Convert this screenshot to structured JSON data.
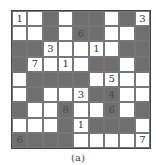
{
  "figure": {
    "caption": "(a)",
    "rows": 9,
    "cols": 9,
    "colors": {
      "shaded": "#6f6f6f",
      "unshaded": "#ffffff",
      "border": "#444444"
    }
  },
  "grid": [
    [
      {
        "s": 0,
        "n": "1"
      },
      {
        "s": 0,
        "n": ""
      },
      {
        "s": 1,
        "n": ""
      },
      {
        "s": 0,
        "n": ""
      },
      {
        "s": 1,
        "n": ""
      },
      {
        "s": 1,
        "n": ""
      },
      {
        "s": 0,
        "n": ""
      },
      {
        "s": 1,
        "n": ""
      },
      {
        "s": 0,
        "n": "3"
      }
    ],
    [
      {
        "s": 0,
        "n": ""
      },
      {
        "s": 0,
        "n": ""
      },
      {
        "s": 1,
        "n": ""
      },
      {
        "s": 0,
        "n": ""
      },
      {
        "s": 1,
        "n": "6"
      },
      {
        "s": 1,
        "n": ""
      },
      {
        "s": 0,
        "n": ""
      },
      {
        "s": 0,
        "n": ""
      },
      {
        "s": 1,
        "n": ""
      }
    ],
    [
      {
        "s": 1,
        "n": ""
      },
      {
        "s": 1,
        "n": ""
      },
      {
        "s": 0,
        "n": "3"
      },
      {
        "s": 0,
        "n": ""
      },
      {
        "s": 0,
        "n": ""
      },
      {
        "s": 0,
        "n": "1"
      },
      {
        "s": 0,
        "n": ""
      },
      {
        "s": 1,
        "n": ""
      },
      {
        "s": 1,
        "n": ""
      }
    ],
    [
      {
        "s": 1,
        "n": ""
      },
      {
        "s": 0,
        "n": "7"
      },
      {
        "s": 0,
        "n": ""
      },
      {
        "s": 0,
        "n": "1"
      },
      {
        "s": 0,
        "n": ""
      },
      {
        "s": 1,
        "n": ""
      },
      {
        "s": 1,
        "n": ""
      },
      {
        "s": 0,
        "n": ""
      },
      {
        "s": 1,
        "n": ""
      }
    ],
    [
      {
        "s": 0,
        "n": ""
      },
      {
        "s": 1,
        "n": ""
      },
      {
        "s": 1,
        "n": ""
      },
      {
        "s": 1,
        "n": ""
      },
      {
        "s": 1,
        "n": ""
      },
      {
        "s": 0,
        "n": ""
      },
      {
        "s": 0,
        "n": "5"
      },
      {
        "s": 0,
        "n": ""
      },
      {
        "s": 0,
        "n": ""
      }
    ],
    [
      {
        "s": 0,
        "n": ""
      },
      {
        "s": 1,
        "n": ""
      },
      {
        "s": 0,
        "n": ""
      },
      {
        "s": 0,
        "n": ""
      },
      {
        "s": 0,
        "n": "3"
      },
      {
        "s": 1,
        "n": ""
      },
      {
        "s": 1,
        "n": "4"
      },
      {
        "s": 0,
        "n": ""
      },
      {
        "s": 0,
        "n": ""
      }
    ],
    [
      {
        "s": 1,
        "n": ""
      },
      {
        "s": 0,
        "n": ""
      },
      {
        "s": 0,
        "n": ""
      },
      {
        "s": 1,
        "n": "8"
      },
      {
        "s": 0,
        "n": ""
      },
      {
        "s": 0,
        "n": ""
      },
      {
        "s": 1,
        "n": "6"
      },
      {
        "s": 0,
        "n": ""
      },
      {
        "s": 1,
        "n": ""
      }
    ],
    [
      {
        "s": 0,
        "n": ""
      },
      {
        "s": 0,
        "n": ""
      },
      {
        "s": 0,
        "n": ""
      },
      {
        "s": 1,
        "n": ""
      },
      {
        "s": 0,
        "n": "1"
      },
      {
        "s": 1,
        "n": ""
      },
      {
        "s": 1,
        "n": ""
      },
      {
        "s": 1,
        "n": ""
      },
      {
        "s": 0,
        "n": ""
      }
    ],
    [
      {
        "s": 1,
        "n": "6"
      },
      {
        "s": 1,
        "n": ""
      },
      {
        "s": 1,
        "n": ""
      },
      {
        "s": 1,
        "n": ""
      },
      {
        "s": 0,
        "n": ""
      },
      {
        "s": 0,
        "n": ""
      },
      {
        "s": 0,
        "n": ""
      },
      {
        "s": 0,
        "n": ""
      },
      {
        "s": 0,
        "n": "7"
      }
    ]
  ]
}
